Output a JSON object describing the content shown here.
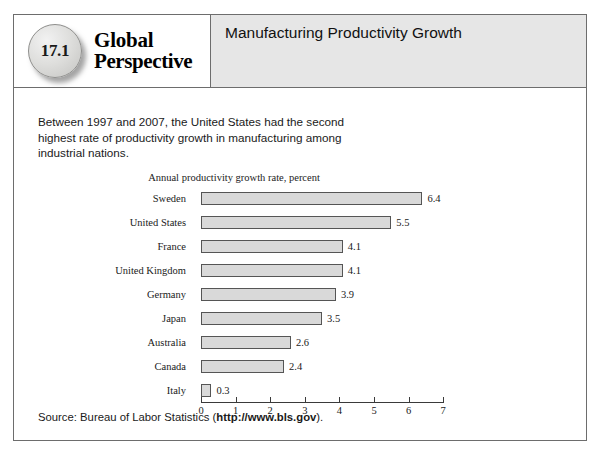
{
  "badge": {
    "number": "17.1",
    "word_line1": "Global",
    "word_line2": "Perspective"
  },
  "header": {
    "title": "Manufacturing Productivity Growth"
  },
  "intro": {
    "text": "Between 1997 and 2007, the United States had the second highest rate of productivity growth in manufacturing among industrial nations."
  },
  "source": {
    "prefix": "Source: Bureau of Labor Statistics (",
    "url": "http://www.bls.gov",
    "suffix": ")."
  },
  "chart_data": {
    "type": "bar",
    "orientation": "horizontal",
    "title": "Annual productivity growth rate, percent",
    "subtitle": "",
    "xlabel": "",
    "ylabel": "",
    "xlim": [
      0,
      7
    ],
    "xticks": [
      "0",
      "1",
      "2",
      "3",
      "4",
      "5",
      "6",
      "7"
    ],
    "grid": false,
    "legend": "none",
    "categories": [
      "Sweden",
      "United States",
      "France",
      "United Kingdom",
      "Germany",
      "Japan",
      "Australia",
      "Canada",
      "Italy"
    ],
    "values": [
      6.4,
      5.5,
      4.1,
      4.1,
      3.9,
      3.5,
      2.6,
      2.4,
      0.3
    ],
    "value_labels": [
      "6.4",
      "5.5",
      "4.1",
      "4.1",
      "3.9",
      "3.5",
      "2.6",
      "2.4",
      "0.3"
    ],
    "bar_fill": "#d9d9d9",
    "bar_stroke": "#555555"
  }
}
